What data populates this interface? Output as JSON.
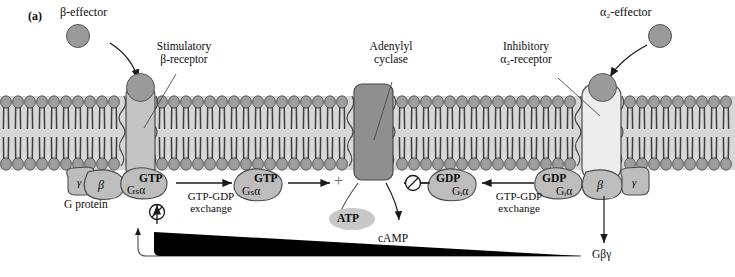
{
  "figure": {
    "panel_label": "(a)",
    "domain": "cell-signaling-diagram",
    "background": "#ffffff"
  },
  "labels": {
    "beta_effector": "β-effector",
    "stimulatory_receptor_l1": "Stimulatory",
    "stimulatory_receptor_l2": "β-receptor",
    "adenylyl_l1": "Adenylyl",
    "adenylyl_l2": "cyclase",
    "inhibitory_receptor_l1": "Inhibitory",
    "inhibitory_receptor_l2": "α₂-receptor",
    "alpha2_effector": "α₂-effector",
    "g_protein": "G protein",
    "exchange_left_l1": "GTP-GDP",
    "exchange_left_l2": "exchange",
    "exchange_right_l1": "GTP-GDP",
    "exchange_right_l2": "exchange",
    "atp": "ATP",
    "camp": "cAMP",
    "plus_sign": "+",
    "g_betagamma": "Gβγ"
  },
  "subunits": {
    "left_gamma": "γ",
    "left_beta": "β",
    "left_gtp_bound": "GTP",
    "left_gsa": "Gₛα",
    "free_gtp": "GTP",
    "free_gsa": "Gₛα",
    "free_gdp": "GDP",
    "free_gia": "Gᵢα",
    "right_gdp": "GDP",
    "right_gia": "Gᵢα",
    "right_beta": "β",
    "right_gamma": "γ"
  },
  "colors": {
    "lipid_head": "#9d9d9d",
    "lipid_tail": "#c9c9c9",
    "receptor_stimulatory": "#c4c4c4",
    "receptor_inhibitory": "#ededed",
    "cyclase": "#8f8f8f",
    "g_subunit": "#bdbdbd",
    "effector_ball": "#9a9a9a",
    "atp_ellipse": "#c8c8c8",
    "stroke": "#4a4a4a",
    "text": "#0d0d0d"
  }
}
